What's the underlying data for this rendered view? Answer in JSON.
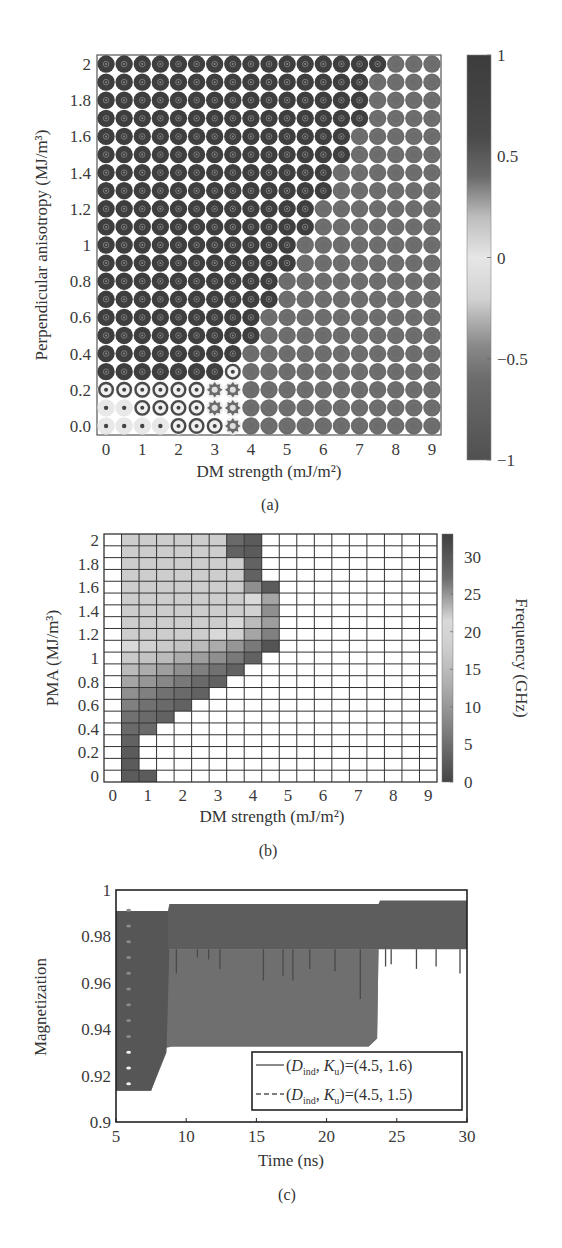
{
  "chart_data": [
    {
      "id": "a",
      "type": "heatmap",
      "caption": "(a)",
      "xlabel": "DM strength (mJ/m²)",
      "ylabel": "Perpendicular anisotropy (MJ/m³)",
      "x_values": [
        0,
        0.5,
        1,
        1.5,
        2,
        2.5,
        3,
        3.5,
        4,
        4.5,
        5,
        5.5,
        6,
        6.5,
        7,
        7.5,
        8,
        8.5,
        9
      ],
      "y_values": [
        0.0,
        0.1,
        0.2,
        0.3,
        0.4,
        0.5,
        0.6,
        0.7,
        0.8,
        0.9,
        1.0,
        1.1,
        1.2,
        1.3,
        1.4,
        1.5,
        1.6,
        1.7,
        1.8,
        1.9,
        2.0
      ],
      "xticks": [
        "0",
        "1",
        "2",
        "3",
        "4",
        "5",
        "6",
        "7",
        "8",
        "9"
      ],
      "xtick_values": [
        0,
        1,
        2,
        3,
        4,
        5,
        6,
        7,
        8,
        9
      ],
      "yticks": [
        "0.0",
        "0.2",
        "0.4",
        "0.6",
        "0.8",
        "1",
        "1.2",
        "1.4",
        "1.6",
        "1.8",
        "2"
      ],
      "ytick_values": [
        0,
        0.2,
        0.4,
        0.6,
        0.8,
        1.0,
        1.2,
        1.4,
        1.6,
        1.8,
        2.0
      ],
      "xlim": [
        -0.25,
        9.25
      ],
      "ylim": [
        -0.05,
        2.05
      ],
      "legend_states": {
        "D": "dark skyrmion (mz ≈ 0.8)",
        "G": "gray helical/stripe state (mz ≈ -0.6)",
        "L": "light, near-uniform state with dot core (mz ≈ 0.1)",
        "R": "ringed skyrmion",
        "S": "star-shaped (spiky) state"
      },
      "state_rows_bottom_to_top": [
        "LLLLRRRSGGGGGGGGGGG",
        "LLRRRRSSGGGGGGGGGGG",
        "RRRRRRSSGGGGGGGGGGG",
        "DDDDDDDRGGGGGGGGGGG",
        "DDDDDDDDGGGGGGGGGGG",
        "DDDDDDDDDGGGGGGGGGG",
        "DDDDDDDDDGGGGGGGGGG",
        "DDDDDDDDDDGGGGGGGGG",
        "DDDDDDDDDDGGGGGGGGG",
        "DDDDDDDDDDDGGGGGGGG",
        "DDDDDDDDDDDGGGGGGGG",
        "DDDDDDDDDDDDGGGGGGG",
        "DDDDDDDDDDDDGGGGGGG",
        "DDDDDDDDDDDDDGGGGGG",
        "DDDDDDDDDDDDDGGGGGG",
        "DDDDDDDDDDDDDDGGGGG",
        "DDDDDDDDDDDDDDGGGGG",
        "DDDDDDDDDDDDDDDGGGG",
        "DDDDDDDDDDDDDDDGGGG",
        "DDDDDDDDDDDDDDDGGGG",
        "DDDDDDDDDDDDDDDDGGG"
      ],
      "colorbar": {
        "range": [
          -1,
          1
        ],
        "ticks": [
          "1",
          "0.5",
          "0",
          "−0.5",
          "−1"
        ],
        "tick_values": [
          1,
          0.5,
          0,
          -0.5,
          -1
        ]
      }
    },
    {
      "id": "b",
      "type": "heatmap",
      "caption": "(b)",
      "xlabel": "DM strength (mJ/m²)",
      "ylabel": "PMA (MJ/m³)",
      "x_values": [
        0,
        0.5,
        1,
        1.5,
        2,
        2.5,
        3,
        3.5,
        4,
        4.5,
        5,
        5.5,
        6,
        6.5,
        7,
        7.5,
        8,
        8.5,
        9
      ],
      "y_values": [
        0.0,
        0.1,
        0.2,
        0.3,
        0.4,
        0.5,
        0.6,
        0.7,
        0.8,
        0.9,
        1.0,
        1.1,
        1.2,
        1.3,
        1.4,
        1.5,
        1.6,
        1.7,
        1.8,
        1.9,
        2.0
      ],
      "xticks": [
        "0",
        "1",
        "2",
        "3",
        "4",
        "5",
        "6",
        "7",
        "8",
        "9"
      ],
      "xtick_values": [
        0,
        1,
        2,
        3,
        4,
        5,
        6,
        7,
        8,
        9
      ],
      "yticks": [
        "0",
        "0.2",
        "0.4",
        "0.6",
        "0.8",
        "1",
        "1.2",
        "1.4",
        "1.6",
        "1.8",
        "2"
      ],
      "ytick_values": [
        0,
        0.2,
        0.4,
        0.6,
        0.8,
        1.0,
        1.2,
        1.4,
        1.6,
        1.8,
        2.0
      ],
      "xlim": [
        -0.25,
        9.25
      ],
      "ylim": [
        -0.05,
        2.05
      ],
      "frequency_GHz_rows_bottom_to_top": [
        [
          null,
          3,
          3,
          null,
          null,
          null,
          null,
          null,
          null,
          null,
          null,
          null,
          null,
          null,
          null,
          null,
          null,
          null,
          null
        ],
        [
          null,
          3,
          null,
          null,
          null,
          null,
          null,
          null,
          null,
          null,
          null,
          null,
          null,
          null,
          null,
          null,
          null,
          null,
          null
        ],
        [
          null,
          3,
          null,
          null,
          null,
          null,
          null,
          null,
          null,
          null,
          null,
          null,
          null,
          null,
          null,
          null,
          null,
          null,
          null
        ],
        [
          null,
          4,
          null,
          null,
          null,
          null,
          null,
          null,
          null,
          null,
          null,
          null,
          null,
          null,
          null,
          null,
          null,
          null,
          null
        ],
        [
          null,
          5,
          5,
          null,
          null,
          null,
          null,
          null,
          null,
          null,
          null,
          null,
          null,
          null,
          null,
          null,
          null,
          null,
          null
        ],
        [
          null,
          6,
          5,
          4,
          null,
          null,
          null,
          null,
          null,
          null,
          null,
          null,
          null,
          null,
          null,
          null,
          null,
          null,
          null
        ],
        [
          null,
          8,
          6,
          5,
          4,
          null,
          null,
          null,
          null,
          null,
          null,
          null,
          null,
          null,
          null,
          null,
          null,
          null,
          null
        ],
        [
          null,
          10,
          8,
          6,
          5,
          4,
          null,
          null,
          null,
          null,
          null,
          null,
          null,
          null,
          null,
          null,
          null,
          null,
          null
        ],
        [
          null,
          13,
          11,
          9,
          7,
          5,
          4,
          null,
          null,
          null,
          null,
          null,
          null,
          null,
          null,
          null,
          null,
          null,
          null
        ],
        [
          null,
          16,
          14,
          12,
          10,
          8,
          6,
          4,
          null,
          null,
          null,
          null,
          null,
          null,
          null,
          null,
          null,
          null,
          null
        ],
        [
          null,
          18,
          17,
          16,
          14,
          12,
          10,
          7,
          4,
          null,
          null,
          null,
          null,
          null,
          null,
          null,
          null,
          null,
          null
        ],
        [
          null,
          20,
          19,
          18,
          17,
          16,
          14,
          11,
          7,
          2,
          null,
          null,
          null,
          null,
          null,
          null,
          null,
          null,
          null
        ],
        [
          null,
          21,
          21,
          21,
          21,
          21,
          20,
          19,
          13,
          8,
          null,
          null,
          null,
          null,
          null,
          null,
          null,
          null,
          null
        ],
        [
          null,
          21,
          21,
          21,
          21,
          21,
          21,
          20,
          16,
          12,
          null,
          null,
          null,
          null,
          null,
          null,
          null,
          null,
          null
        ],
        [
          null,
          21,
          21,
          21,
          21,
          21,
          21,
          21,
          19,
          10,
          null,
          null,
          null,
          null,
          null,
          null,
          null,
          null,
          null
        ],
        [
          null,
          21,
          21,
          21,
          21,
          21,
          21,
          21,
          20,
          13,
          null,
          null,
          null,
          null,
          null,
          null,
          null,
          null,
          null
        ],
        [
          null,
          21,
          21,
          21,
          21,
          21,
          21,
          21,
          10,
          3,
          null,
          null,
          null,
          null,
          null,
          null,
          null,
          null,
          null
        ],
        [
          null,
          21,
          21,
          21,
          21,
          21,
          21,
          21,
          4,
          null,
          null,
          null,
          null,
          null,
          null,
          null,
          null,
          null,
          null
        ],
        [
          null,
          21,
          21,
          21,
          21,
          21,
          21,
          21,
          4,
          null,
          null,
          null,
          null,
          null,
          null,
          null,
          null,
          null,
          null
        ],
        [
          null,
          21,
          21,
          21,
          21,
          21,
          21,
          4,
          3,
          null,
          null,
          null,
          null,
          null,
          null,
          null,
          null,
          null,
          null
        ],
        [
          null,
          21,
          21,
          21,
          21,
          21,
          21,
          5,
          3,
          null,
          null,
          null,
          null,
          null,
          null,
          null,
          null,
          null,
          null
        ]
      ],
      "colorbar": {
        "label": "Frequency (GHz)",
        "range": [
          0,
          33
        ],
        "ticks": [
          "30",
          "25",
          "20",
          "15",
          "10",
          "5",
          "0"
        ],
        "tick_values": [
          30,
          25,
          20,
          15,
          10,
          5,
          0
        ]
      }
    },
    {
      "id": "c",
      "type": "area",
      "caption": "(c)",
      "xlabel": "Time (ns)",
      "ylabel": "Magnetization",
      "xlim": [
        5,
        30
      ],
      "ylim": [
        0.9,
        1.0
      ],
      "xticks": [
        "5",
        "10",
        "15",
        "20",
        "25",
        "30"
      ],
      "xtick_values": [
        5,
        10,
        15,
        20,
        25,
        30
      ],
      "yticks": [
        "0.9",
        "0.92",
        "0.94",
        "0.96",
        "0.98",
        "1"
      ],
      "ytick_values": [
        0.9,
        0.92,
        0.94,
        0.96,
        0.98,
        1.0
      ],
      "legend_position": "lower-right",
      "series": [
        {
          "name": "(D_ind, K_u)=(4.5, 1.6)",
          "legend_prefix": "(",
          "legend_D": "D",
          "legend_D_sub": "ind",
          "legend_mid": ", ",
          "legend_K": "K",
          "legend_K_sub": "u",
          "legend_suffix": ")=(4.5, 1.6)",
          "style": "solid",
          "color": "#6f6f6f",
          "description": "Fast oscillation band",
          "band_upper": [
            [
              5,
              0.991
            ],
            [
              8.7,
              0.991
            ],
            [
              8.7,
              0.9745
            ],
            [
              23.6,
              0.9745
            ]
          ],
          "band_lower": [
            [
              5,
              0.9135
            ],
            [
              7.5,
              0.9135
            ],
            [
              8.6,
              0.932
            ],
            [
              9.0,
              0.9325
            ],
            [
              23.0,
              0.9325
            ],
            [
              23.6,
              0.936
            ],
            [
              23.7,
              0.9745
            ]
          ]
        },
        {
          "name": "(D_ind, K_u)=(4.5, 1.5)",
          "legend_prefix": "(",
          "legend_D": "D",
          "legend_D_sub": "ind",
          "legend_mid": ", ",
          "legend_K": "K",
          "legend_K_sub": "u",
          "legend_suffix": ")=(4.5, 1.5)",
          "style": "dashed",
          "color": "#545454",
          "description": "Fast oscillation band",
          "band_upper": [
            [
              5,
              0.991
            ],
            [
              8.7,
              0.991
            ],
            [
              8.8,
              0.994
            ],
            [
              23.7,
              0.994
            ],
            [
              23.8,
              0.9955
            ],
            [
              30,
              0.9955
            ]
          ],
          "band_lower": [
            [
              5,
              0.9135
            ],
            [
              7.5,
              0.9135
            ],
            [
              8.6,
              0.93
            ],
            [
              8.8,
              0.9745
            ],
            [
              30,
              0.9745
            ]
          ],
          "spikes_down_to": [
            [
              9.3,
              0.964
            ],
            [
              10.8,
              0.971
            ],
            [
              11.6,
              0.97
            ],
            [
              12.4,
              0.966
            ],
            [
              15.5,
              0.961
            ],
            [
              16.9,
              0.963
            ],
            [
              17.6,
              0.961
            ],
            [
              18.8,
              0.966
            ],
            [
              20.6,
              0.965
            ],
            [
              22.4,
              0.953
            ],
            [
              24.2,
              0.967
            ],
            [
              24.6,
              0.968
            ],
            [
              26.4,
              0.966
            ],
            [
              27.8,
              0.967
            ],
            [
              29.5,
              0.964
            ]
          ]
        }
      ]
    }
  ]
}
